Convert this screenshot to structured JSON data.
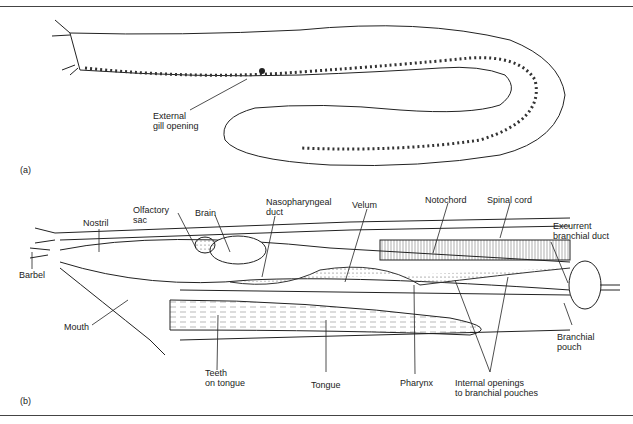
{
  "figure": {
    "panel_a": {
      "tag": "(a)",
      "labels": {
        "external_gill_opening": "External\ngill opening"
      }
    },
    "panel_b": {
      "tag": "(b)",
      "labels": {
        "nostril": "Nostril",
        "olfactory_sac": "Olfactory\nsac",
        "brain": "Brain",
        "nasopharyngeal_duct": "Nasopharyngeal\nduct",
        "velum": "Velum",
        "notochord": "Notochord",
        "spinal_cord": "Spinal cord",
        "excurrent_branchial_duct": "Excurrent\nbranchial duct",
        "barbel": "Barbel",
        "mouth": "Mouth",
        "teeth_on_tongue": "Teeth\non tongue",
        "tongue": "Tongue",
        "pharynx": "Pharynx",
        "internal_openings": "Internal openings\nto branchial pouches",
        "branchial_pouch": "Branchial\npouch"
      }
    }
  }
}
